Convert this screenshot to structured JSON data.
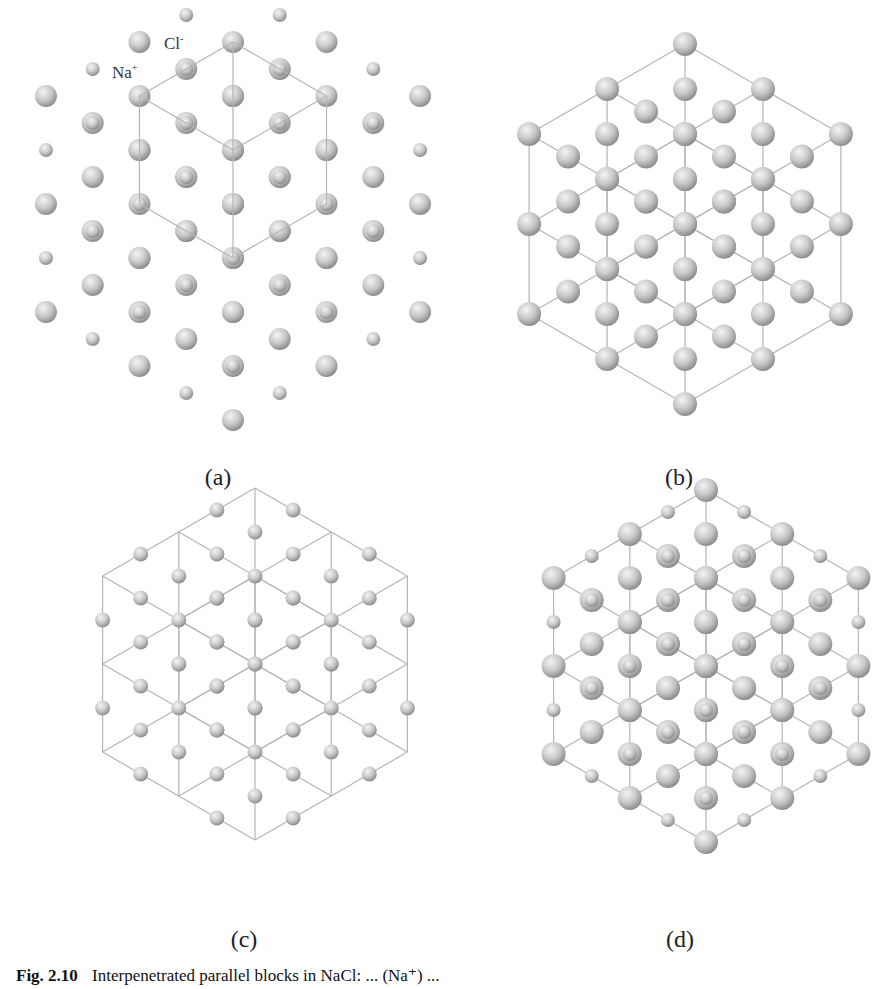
{
  "figure": {
    "panels": [
      {
        "id": "a",
        "label": "(a)",
        "description": "NaCl crystal, sphere model with one unit cell outlined"
      },
      {
        "id": "b",
        "label": "(b)",
        "description": "Large-ion sublattice with 2x2x2 cubic wireframe"
      },
      {
        "id": "c",
        "label": "(c)",
        "description": "Small-ion sublattice within cubic wireframe"
      },
      {
        "id": "d",
        "label": "(d)",
        "description": "Interpenetrated lattices with wireframe"
      }
    ],
    "ion_labels": {
      "cl": {
        "symbol": "Cl",
        "charge": "-"
      },
      "na": {
        "symbol": "Na",
        "charge": "+"
      }
    },
    "caption": {
      "number": "Fig. 2.10",
      "text": "Interpenetrated parallel blocks in NaCl: ... (Na⁺) ..."
    },
    "colors": {
      "sphere_light": "#f4f4f4",
      "sphere_mid": "#c8c8c8",
      "sphere_dark": "#8a8a8a",
      "line": "#b5b5b5"
    }
  }
}
